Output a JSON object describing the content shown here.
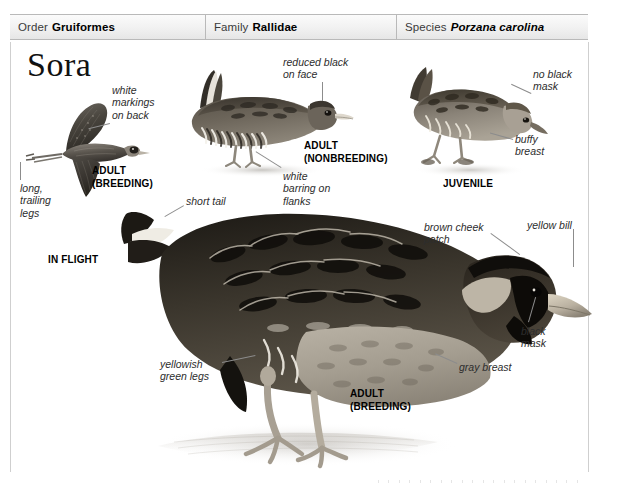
{
  "header": {
    "cells": [
      {
        "rank": "Order",
        "name": "Gruiformes",
        "italic": false
      },
      {
        "rank": "Family",
        "name": "Rallidae",
        "italic": false
      },
      {
        "rank": "Species",
        "name": "Porzana carolina",
        "italic": true
      }
    ]
  },
  "title": "Sora",
  "figures": {
    "in_flight": {
      "caption_line1": "ADULT",
      "caption_line2": "(BREEDING)",
      "plate_caption": "IN FLIGHT",
      "labels": {
        "back": "white\nmarkings\non back",
        "legs": "long,\ntrailing\nlegs"
      }
    },
    "nonbreeding": {
      "caption_line1": "ADULT",
      "caption_line2": "(NONBREEDING)",
      "labels": {
        "face": "reduced black\non face",
        "flanks": "white\nbarring on\nflanks"
      }
    },
    "juvenile": {
      "plate_caption": "JUVENILE",
      "labels": {
        "mask": "no black\nmask",
        "breast": "buffy\nbreast"
      }
    },
    "breeding_adult": {
      "caption_line1": "ADULT",
      "caption_line2": "(BREEDING)",
      "labels": {
        "tail": "short tail",
        "legs": "yellowish\ngreen legs",
        "cheek": "brown cheek\npatch",
        "bill": "yellow bill",
        "mask": "black\nmask",
        "breast": "gray breast"
      }
    }
  },
  "colors": {
    "rule": "#cfcfcf",
    "bar_border": "#b9b9b9",
    "text": "#2d2d2d",
    "leader": "#8c8c8c"
  }
}
